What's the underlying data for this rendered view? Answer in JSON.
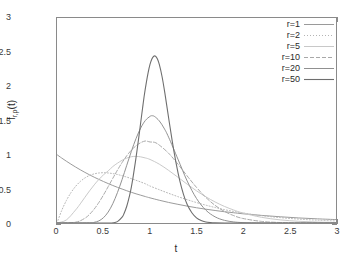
{
  "chart_data": {
    "type": "line",
    "title": "",
    "xlabel": "t",
    "ylabel": "f_{r,ρ}(t)",
    "ylabel_main": "f",
    "ylabel_sub": "r,ρ",
    "ylabel_arg": "(t)",
    "xlim": [
      0,
      3
    ],
    "ylim": [
      0,
      3
    ],
    "xticks": [
      "0",
      "0.5",
      "1",
      "1.5",
      "2",
      "2.5",
      "3"
    ],
    "xtick_values": [
      0,
      0.5,
      1,
      1.5,
      2,
      2.5,
      3
    ],
    "yticks": [
      "0",
      "0.5",
      "1",
      "1.5",
      "2",
      "2.5",
      "3"
    ],
    "ytick_values": [
      0,
      0.5,
      1,
      1.5,
      2,
      2.5,
      3
    ],
    "grid": false,
    "legend_position": "top-right",
    "background": "#ffffff",
    "frame_color": "#8a8a8a",
    "series": [
      {
        "name": "r=1",
        "label": "r=1",
        "color": "#9a9a9a",
        "dash": "none",
        "width": 1.0,
        "peak_t": 0.0,
        "peak_value": 1.0,
        "points": [
          [
            0.0,
            1.0
          ],
          [
            0.05,
            0.951
          ],
          [
            0.1,
            0.905
          ],
          [
            0.15,
            0.861
          ],
          [
            0.2,
            0.819
          ],
          [
            0.25,
            0.779
          ],
          [
            0.3,
            0.741
          ],
          [
            0.35,
            0.705
          ],
          [
            0.4,
            0.67
          ],
          [
            0.45,
            0.638
          ],
          [
            0.5,
            0.607
          ],
          [
            0.55,
            0.577
          ],
          [
            0.6,
            0.549
          ],
          [
            0.65,
            0.522
          ],
          [
            0.7,
            0.497
          ],
          [
            0.75,
            0.472
          ],
          [
            0.8,
            0.449
          ],
          [
            0.85,
            0.427
          ],
          [
            0.9,
            0.407
          ],
          [
            0.95,
            0.387
          ],
          [
            1.0,
            0.368
          ],
          [
            1.1,
            0.333
          ],
          [
            1.2,
            0.301
          ],
          [
            1.3,
            0.273
          ],
          [
            1.4,
            0.247
          ],
          [
            1.5,
            0.223
          ],
          [
            1.6,
            0.202
          ],
          [
            1.7,
            0.183
          ],
          [
            1.8,
            0.165
          ],
          [
            1.9,
            0.15
          ],
          [
            2.0,
            0.135
          ],
          [
            2.2,
            0.111
          ],
          [
            2.4,
            0.091
          ],
          [
            2.6,
            0.074
          ],
          [
            2.8,
            0.061
          ],
          [
            3.0,
            0.05
          ]
        ]
      },
      {
        "name": "r=2",
        "label": "r=2",
        "color": "#b4b4b4",
        "dash": "1,2",
        "width": 1.0,
        "peak_t": 0.5,
        "peak_value": 0.736,
        "points": [
          [
            0.0,
            0.0
          ],
          [
            0.05,
            0.181
          ],
          [
            0.1,
            0.327
          ],
          [
            0.15,
            0.444
          ],
          [
            0.2,
            0.536
          ],
          [
            0.25,
            0.607
          ],
          [
            0.3,
            0.659
          ],
          [
            0.35,
            0.696
          ],
          [
            0.4,
            0.719
          ],
          [
            0.45,
            0.732
          ],
          [
            0.5,
            0.736
          ],
          [
            0.55,
            0.732
          ],
          [
            0.6,
            0.723
          ],
          [
            0.65,
            0.71
          ],
          [
            0.7,
            0.692
          ],
          [
            0.75,
            0.672
          ],
          [
            0.8,
            0.649
          ],
          [
            0.85,
            0.625
          ],
          [
            0.9,
            0.6
          ],
          [
            0.95,
            0.574
          ],
          [
            1.0,
            0.541
          ],
          [
            1.1,
            0.487
          ],
          [
            1.2,
            0.435
          ],
          [
            1.3,
            0.386
          ],
          [
            1.4,
            0.341
          ],
          [
            1.5,
            0.299
          ],
          [
            1.6,
            0.261
          ],
          [
            1.7,
            0.227
          ],
          [
            1.8,
            0.196
          ],
          [
            1.9,
            0.169
          ],
          [
            2.0,
            0.147
          ],
          [
            2.2,
            0.108
          ],
          [
            2.4,
            0.079
          ],
          [
            2.6,
            0.057
          ],
          [
            2.8,
            0.041
          ],
          [
            3.0,
            0.03
          ]
        ]
      },
      {
        "name": "r=5",
        "label": "r=5",
        "color": "#c8c8c8",
        "dash": "none",
        "width": 1.0,
        "peak_t": 0.8,
        "peak_value": 0.975,
        "points": [
          [
            0.0,
            0.0
          ],
          [
            0.1,
            0.044
          ],
          [
            0.2,
            0.191
          ],
          [
            0.25,
            0.28
          ],
          [
            0.3,
            0.376
          ],
          [
            0.35,
            0.47
          ],
          [
            0.4,
            0.558
          ],
          [
            0.45,
            0.637
          ],
          [
            0.5,
            0.705
          ],
          [
            0.55,
            0.762
          ],
          [
            0.6,
            0.826
          ],
          [
            0.65,
            0.875
          ],
          [
            0.7,
            0.918
          ],
          [
            0.75,
            0.95
          ],
          [
            0.8,
            0.97
          ],
          [
            0.85,
            0.975
          ],
          [
            0.9,
            0.968
          ],
          [
            0.95,
            0.952
          ],
          [
            1.0,
            0.93
          ],
          [
            1.1,
            0.861
          ],
          [
            1.2,
            0.77
          ],
          [
            1.3,
            0.67
          ],
          [
            1.4,
            0.568
          ],
          [
            1.5,
            0.471
          ],
          [
            1.6,
            0.384
          ],
          [
            1.7,
            0.308
          ],
          [
            1.8,
            0.243
          ],
          [
            1.9,
            0.19
          ],
          [
            2.0,
            0.146
          ],
          [
            2.2,
            0.083
          ],
          [
            2.4,
            0.046
          ],
          [
            2.6,
            0.025
          ],
          [
            2.8,
            0.013
          ],
          [
            3.0,
            0.007
          ]
        ]
      },
      {
        "name": "r=10",
        "label": "r=10",
        "color": "#a8a8a8",
        "dash": "4,2",
        "width": 1.0,
        "peak_t": 0.9,
        "peak_value": 1.318,
        "points": [
          [
            0.0,
            0.0
          ],
          [
            0.2,
            0.012
          ],
          [
            0.3,
            0.07
          ],
          [
            0.35,
            0.127
          ],
          [
            0.4,
            0.204
          ],
          [
            0.45,
            0.3
          ],
          [
            0.5,
            0.411
          ],
          [
            0.55,
            0.531
          ],
          [
            0.6,
            0.654
          ],
          [
            0.65,
            0.774
          ],
          [
            0.7,
            0.885
          ],
          [
            0.75,
            0.984
          ],
          [
            0.8,
            1.066
          ],
          [
            0.85,
            1.13
          ],
          [
            0.9,
            1.175
          ],
          [
            0.95,
            1.2
          ],
          [
            1.0,
            1.186
          ],
          [
            1.05,
            1.18
          ],
          [
            1.1,
            1.14
          ],
          [
            1.2,
            1.021
          ],
          [
            1.3,
            0.862
          ],
          [
            1.4,
            0.688
          ],
          [
            1.5,
            0.521
          ],
          [
            1.6,
            0.375
          ],
          [
            1.7,
            0.258
          ],
          [
            1.8,
            0.17
          ],
          [
            1.9,
            0.108
          ],
          [
            2.0,
            0.066
          ],
          [
            2.2,
            0.023
          ],
          [
            2.4,
            0.007
          ],
          [
            2.6,
            0.002
          ],
          [
            2.8,
            0.001
          ],
          [
            3.0,
            0.0
          ]
        ]
      },
      {
        "name": "r=20",
        "label": "r=20",
        "color": "#909090",
        "dash": "none",
        "width": 1.0,
        "peak_t": 0.95,
        "peak_value": 1.815,
        "points": [
          [
            0.0,
            0.0
          ],
          [
            0.35,
            0.002
          ],
          [
            0.4,
            0.01
          ],
          [
            0.45,
            0.031
          ],
          [
            0.5,
            0.078
          ],
          [
            0.55,
            0.16
          ],
          [
            0.6,
            0.283
          ],
          [
            0.65,
            0.445
          ],
          [
            0.7,
            0.637
          ],
          [
            0.75,
            0.845
          ],
          [
            0.8,
            1.05
          ],
          [
            0.85,
            1.237
          ],
          [
            0.9,
            1.39
          ],
          [
            0.95,
            1.5
          ],
          [
            1.0,
            1.56
          ],
          [
            1.02,
            1.57
          ],
          [
            1.05,
            1.558
          ],
          [
            1.1,
            1.494
          ],
          [
            1.15,
            1.39
          ],
          [
            1.2,
            1.256
          ],
          [
            1.3,
            0.936
          ],
          [
            1.4,
            0.614
          ],
          [
            1.5,
            0.359
          ],
          [
            1.6,
            0.189
          ],
          [
            1.7,
            0.09
          ],
          [
            1.8,
            0.039
          ],
          [
            1.9,
            0.016
          ],
          [
            2.0,
            0.006
          ],
          [
            2.2,
            0.001
          ],
          [
            2.4,
            0.0
          ],
          [
            3.0,
            0.0
          ]
        ]
      },
      {
        "name": "r=50",
        "label": "r=50",
        "color": "#6e6e6e",
        "dash": "none",
        "width": 1.1,
        "peak_t": 0.98,
        "peak_value": 2.83,
        "points": [
          [
            0.0,
            0.0
          ],
          [
            0.55,
            0.0
          ],
          [
            0.6,
            0.003
          ],
          [
            0.65,
            0.02
          ],
          [
            0.7,
            0.085
          ],
          [
            0.72,
            0.135
          ],
          [
            0.75,
            0.245
          ],
          [
            0.78,
            0.4
          ],
          [
            0.8,
            0.53
          ],
          [
            0.82,
            0.69
          ],
          [
            0.85,
            0.96
          ],
          [
            0.88,
            1.26
          ],
          [
            0.9,
            1.47
          ],
          [
            0.92,
            1.68
          ],
          [
            0.94,
            1.88
          ],
          [
            0.96,
            2.05
          ],
          [
            0.98,
            2.2
          ],
          [
            1.0,
            2.32
          ],
          [
            1.02,
            2.4
          ],
          [
            1.04,
            2.44
          ],
          [
            1.06,
            2.44
          ],
          [
            1.08,
            2.4
          ],
          [
            1.1,
            2.32
          ],
          [
            1.13,
            2.14
          ],
          [
            1.16,
            1.9
          ],
          [
            1.2,
            1.54
          ],
          [
            1.24,
            1.19
          ],
          [
            1.28,
            0.88
          ],
          [
            1.32,
            0.62
          ],
          [
            1.36,
            0.42
          ],
          [
            1.4,
            0.27
          ],
          [
            1.45,
            0.15
          ],
          [
            1.5,
            0.075
          ],
          [
            1.55,
            0.035
          ],
          [
            1.6,
            0.015
          ],
          [
            1.65,
            0.006
          ],
          [
            1.7,
            0.002
          ],
          [
            1.8,
            0.0
          ],
          [
            2.0,
            0.0
          ],
          [
            3.0,
            0.0
          ]
        ]
      }
    ]
  }
}
